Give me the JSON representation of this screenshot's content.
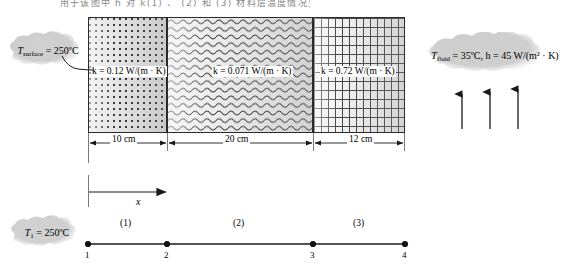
{
  "figure": {
    "header_text": "用于该图中 h 对 k(1) 、 (2) 和 (3) 材料层温度情况变化 各区域分布",
    "x_axis_label": "x",
    "layers": [
      {
        "id": "layer-1",
        "index": 1,
        "pattern": "dotted",
        "k_label": "k = 0.12 W/(m · K)",
        "thickness_label": "10 cm",
        "thickness_cm": 10,
        "k_value": 0.12
      },
      {
        "id": "layer-2",
        "index": 2,
        "pattern": "wavy",
        "k_label": "k = 0.071 W/(m · K)",
        "thickness_label": "20 cm",
        "thickness_cm": 20,
        "k_value": 0.071
      },
      {
        "id": "layer-3",
        "index": 3,
        "pattern": "brick",
        "k_label": "k = 0.72 W/(m · K)",
        "thickness_label": "12 cm",
        "thickness_cm": 12,
        "k_value": 0.72
      }
    ],
    "callouts": {
      "surface": {
        "symbol": "T",
        "subscript": "surface",
        "value": " = 250ºC",
        "full": "T_surface = 250ºC"
      },
      "fluid": {
        "symbol": "T",
        "subscript": "fluid",
        "value": " = 35ºC, h = 45 W/(m² · K)",
        "full": "T_fluid = 35ºC, h = 45 W/(m2 · K)"
      },
      "node_temp": {
        "symbol": "T",
        "subscript": "1",
        "value": " = 250ºC",
        "full": "T1 = 250ºC"
      }
    },
    "network": {
      "segments": [
        {
          "label": "(1)"
        },
        {
          "label": "(2)"
        },
        {
          "label": "(3)"
        }
      ],
      "nodes": [
        {
          "label": "1"
        },
        {
          "label": "2"
        },
        {
          "label": "3"
        },
        {
          "label": "4"
        }
      ]
    },
    "colors": {
      "line": "#1a1a1a",
      "cloud_fill": "#b8b8b8",
      "background": "#ffffff",
      "brick_line": "#444444"
    }
  }
}
